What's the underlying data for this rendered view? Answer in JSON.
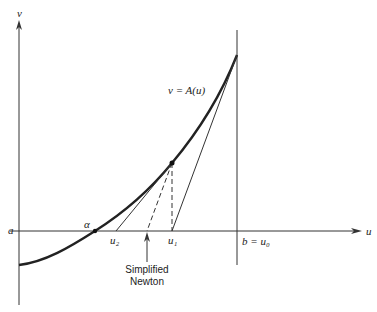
{
  "diagram": {
    "labels": {
      "y_axis": "v",
      "x_axis": "u",
      "a": "a",
      "alpha": "α",
      "u2": "u₂",
      "u1": "u₁",
      "b_u0": "b = u₀",
      "curve": "v = A(u)",
      "simplified_line1": "Simplified",
      "simplified_line2": "Newton"
    },
    "colors": {
      "ink": "#222222",
      "background": "#ffffff"
    }
  }
}
